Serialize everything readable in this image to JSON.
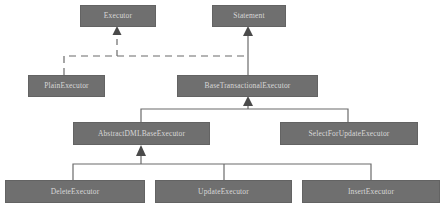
{
  "diagram": {
    "type": "uml-class-hierarchy",
    "canvas": {
      "width": 447,
      "height": 217,
      "background": "#ffffff"
    },
    "style": {
      "node_fill": "#6f6f6f",
      "node_border": "#636363",
      "node_text": "#d8d8d8",
      "edge_color": "#6b6b6b",
      "arrow_color": "#4a4a4a"
    },
    "nodes": [
      {
        "id": "executor",
        "label": "Executor",
        "x": 80,
        "y": 5,
        "w": 76,
        "h": 22
      },
      {
        "id": "statement",
        "label": "Statement",
        "x": 212,
        "y": 5,
        "w": 74,
        "h": 22
      },
      {
        "id": "plain_executor",
        "label": "PlainExecutor",
        "x": 28,
        "y": 75,
        "w": 77,
        "h": 22
      },
      {
        "id": "base_transactional_executor",
        "label": "BaseTransactionalExecutor",
        "x": 177,
        "y": 75,
        "w": 141,
        "h": 22
      },
      {
        "id": "abstract_dml_base_executor",
        "label": "AbstractDMLBaseExecutor",
        "x": 73,
        "y": 122,
        "w": 137,
        "h": 23
      },
      {
        "id": "select_for_update_executor",
        "label": "SelectForUpdateExecutor",
        "x": 280,
        "y": 122,
        "w": 138,
        "h": 23
      },
      {
        "id": "delete_executor",
        "label": "DeleteExecutor",
        "x": 5,
        "y": 180,
        "w": 140,
        "h": 23
      },
      {
        "id": "update_executor",
        "label": "UpdateExecutor",
        "x": 155,
        "y": 180,
        "w": 137,
        "h": 23
      },
      {
        "id": "insert_executor",
        "label": "InsertExecutor",
        "x": 302,
        "y": 180,
        "w": 138,
        "h": 23
      }
    ],
    "edges": [
      {
        "id": "plain-implements-executor",
        "from": "plain_executor",
        "to": "executor",
        "kind": "realization",
        "line": "dashed"
      },
      {
        "id": "base-implements-executor",
        "from": "base_transactional_executor",
        "to": "executor",
        "kind": "realization",
        "line": "dashed"
      },
      {
        "id": "base-extends-statement",
        "from": "base_transactional_executor",
        "to": "statement",
        "kind": "generalization",
        "line": "solid"
      },
      {
        "id": "abstractdml-extends-base",
        "from": "abstract_dml_base_executor",
        "to": "base_transactional_executor",
        "kind": "generalization",
        "line": "solid"
      },
      {
        "id": "selectforupdate-extends-base",
        "from": "select_for_update_executor",
        "to": "base_transactional_executor",
        "kind": "generalization",
        "line": "solid"
      },
      {
        "id": "delete-extends-abstractdml",
        "from": "delete_executor",
        "to": "abstract_dml_base_executor",
        "kind": "generalization",
        "line": "solid"
      },
      {
        "id": "update-extends-abstractdml",
        "from": "update_executor",
        "to": "abstract_dml_base_executor",
        "kind": "generalization",
        "line": "solid"
      },
      {
        "id": "insert-extends-abstractdml",
        "from": "insert_executor",
        "to": "abstract_dml_base_executor",
        "kind": "generalization",
        "line": "solid"
      }
    ]
  }
}
